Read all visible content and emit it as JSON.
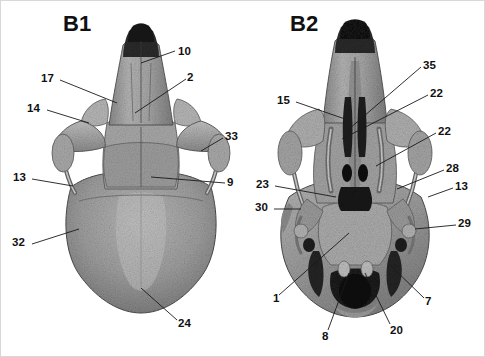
{
  "figure": {
    "background_color": "#ffffff",
    "ink_color": "#111111",
    "panels": [
      {
        "id": "B1",
        "label": "B1",
        "view": "dorsal skull"
      },
      {
        "id": "B2",
        "label": "B2",
        "view": "ventral skull"
      }
    ]
  },
  "panel_b1": {
    "title": "B1",
    "title_x": 62,
    "title_y": 12,
    "labels": [
      {
        "text": "10",
        "x": 177,
        "y": 45,
        "anchor_x": 140,
        "anchor_y": 62
      },
      {
        "text": "17",
        "x": 40,
        "y": 72,
        "anchor_x": 116,
        "anchor_y": 102
      },
      {
        "text": "2",
        "x": 186,
        "y": 71,
        "anchor_x": 134,
        "anchor_y": 112
      },
      {
        "text": "14",
        "x": 26,
        "y": 102,
        "anchor_x": 88,
        "anchor_y": 122
      },
      {
        "text": "33",
        "x": 224,
        "y": 130,
        "anchor_x": 200,
        "anchor_y": 150
      },
      {
        "text": "13",
        "x": 12,
        "y": 171,
        "anchor_x": 72,
        "anchor_y": 185
      },
      {
        "text": "9",
        "x": 226,
        "y": 176,
        "anchor_x": 150,
        "anchor_y": 176
      },
      {
        "text": "32",
        "x": 11,
        "y": 236,
        "anchor_x": 78,
        "anchor_y": 228
      },
      {
        "text": "24",
        "x": 177,
        "y": 317,
        "anchor_x": 140,
        "anchor_y": 287
      }
    ]
  },
  "panel_b2": {
    "title": "B2",
    "title_x": 289,
    "title_y": 12,
    "labels": [
      {
        "text": "35",
        "x": 422,
        "y": 59,
        "anchor_x": 348,
        "anchor_y": 128
      },
      {
        "text": "15",
        "x": 276,
        "y": 94,
        "anchor_x": 344,
        "anchor_y": 118
      },
      {
        "text": "22",
        "x": 429,
        "y": 87,
        "anchor_x": 341,
        "anchor_y": 136
      },
      {
        "text": "22",
        "x": 437,
        "y": 125,
        "anchor_x": 375,
        "anchor_y": 165
      },
      {
        "text": "28",
        "x": 445,
        "y": 162,
        "anchor_x": 396,
        "anchor_y": 188
      },
      {
        "text": "23",
        "x": 255,
        "y": 178,
        "anchor_x": 335,
        "anchor_y": 196
      },
      {
        "text": "13",
        "x": 454,
        "y": 180,
        "anchor_x": 427,
        "anchor_y": 196
      },
      {
        "text": "30",
        "x": 254,
        "y": 201,
        "anchor_x": 300,
        "anchor_y": 208
      },
      {
        "text": "29",
        "x": 457,
        "y": 217,
        "anchor_x": 414,
        "anchor_y": 228
      },
      {
        "text": "1",
        "x": 272,
        "y": 292,
        "anchor_x": 348,
        "anchor_y": 232
      },
      {
        "text": "7",
        "x": 424,
        "y": 295,
        "anchor_x": 390,
        "anchor_y": 265
      },
      {
        "text": "20",
        "x": 389,
        "y": 324,
        "anchor_x": 364,
        "anchor_y": 272
      },
      {
        "text": "8",
        "x": 321,
        "y": 330,
        "anchor_x": 348,
        "anchor_y": 272
      }
    ]
  }
}
